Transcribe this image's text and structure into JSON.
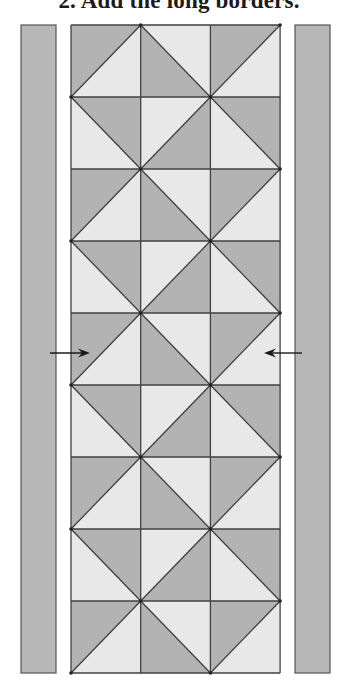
{
  "title": "2. Add the long borders.",
  "colors": {
    "dark": "#b3b3b3",
    "light": "#e8e8e8",
    "border_strip": "#b7b7b7",
    "line": "#404040",
    "arrow": "#1a1a1a"
  },
  "diagram": {
    "left_border": {
      "x": 21,
      "y": 25,
      "w": 35,
      "h": 648
    },
    "right_border": {
      "x": 295,
      "y": 25,
      "w": 35,
      "h": 648
    },
    "grid": {
      "x": 71,
      "y": 25,
      "cols": 3,
      "rows": 9,
      "cell_w": 69.7,
      "cell_h": 72
    },
    "row_patterns": {
      "even": [
        {
          "diag": "/",
          "dark": "upper-left"
        },
        {
          "diag": "\\",
          "dark": "lower-left"
        },
        {
          "diag": "/",
          "dark": "upper-left"
        }
      ],
      "odd": [
        {
          "diag": "\\",
          "dark": "upper-right"
        },
        {
          "diag": "/",
          "dark": "lower-right"
        },
        {
          "diag": "\\",
          "dark": "upper-right"
        }
      ]
    },
    "arrows": [
      {
        "name": "left-arrow",
        "x1": 50,
        "x2": 90,
        "y": 353,
        "direction": "right"
      },
      {
        "name": "right-arrow",
        "x1": 302,
        "x2": 264,
        "y": 353,
        "direction": "left"
      }
    ]
  }
}
